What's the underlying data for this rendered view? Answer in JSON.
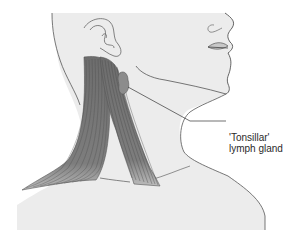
{
  "figure": {
    "annotations": [
      {
        "line1": "'Tonsillar'",
        "line2": "lymph gland"
      }
    ],
    "colors": {
      "skin": "#ebebeb",
      "outline": "#555555",
      "muscle": "#7a7a7a",
      "muscle_dark": "#5a5a5a",
      "gland": "#8c8c8c",
      "leader_line": "#333333"
    }
  }
}
